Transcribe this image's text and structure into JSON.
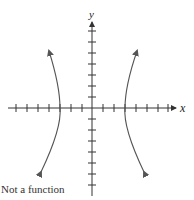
{
  "diagram": {
    "axes": {
      "x_label": "x",
      "y_label": "y",
      "x_ticks": 14,
      "y_ticks": 14,
      "colors": {
        "axis": "#333333",
        "curve": "#555555"
      }
    },
    "curves": [
      {
        "name": "left-branch",
        "description": "curve opening left, vertex on negative x-axis at x=-3"
      },
      {
        "name": "right-branch",
        "description": "curve opening right, vertex on positive x-axis at x=3"
      }
    ],
    "caption": "Not a function"
  }
}
